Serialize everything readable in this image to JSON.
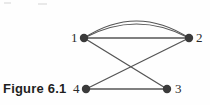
{
  "figure": {
    "caption": "Figure 6.1",
    "background_color": "#fefefe",
    "stroke_color": "#555555",
    "node_color": "#3a3a3a",
    "label_color": "#2b2b2b"
  },
  "graph": {
    "type": "undirected-multigraph",
    "nodes": [
      {
        "id": "1",
        "label": "1",
        "cx": 84,
        "cy": 38,
        "r": 4.2,
        "label_x": 71,
        "label_y": 31
      },
      {
        "id": "2",
        "label": "2",
        "cx": 189,
        "cy": 38,
        "r": 4.2,
        "label_x": 196,
        "label_y": 31
      },
      {
        "id": "3",
        "label": "3",
        "cx": 167,
        "cy": 89,
        "r": 4.2,
        "label_x": 175,
        "label_y": 82
      },
      {
        "id": "4",
        "label": "4",
        "cx": 86,
        "cy": 89,
        "r": 4.2,
        "label_x": 73,
        "label_y": 82
      }
    ],
    "edges": [
      {
        "from": "1",
        "to": "2",
        "shape": "arc",
        "note": "upper parallel arc"
      },
      {
        "from": "1",
        "to": "2",
        "shape": "arc",
        "note": "lower parallel arc"
      },
      {
        "from": "1",
        "to": "2",
        "shape": "straight",
        "note": "horizontal chord"
      },
      {
        "from": "1",
        "to": "3",
        "shape": "straight",
        "note": "diagonal, crosses 2-4"
      },
      {
        "from": "2",
        "to": "4",
        "shape": "straight",
        "note": "diagonal, crosses 1-3"
      },
      {
        "from": "4",
        "to": "3",
        "shape": "straight",
        "note": "bottom horizontal"
      }
    ],
    "edge_count": 6,
    "node_count": 4,
    "crossing_point": {
      "x": 133,
      "y": 68
    }
  }
}
